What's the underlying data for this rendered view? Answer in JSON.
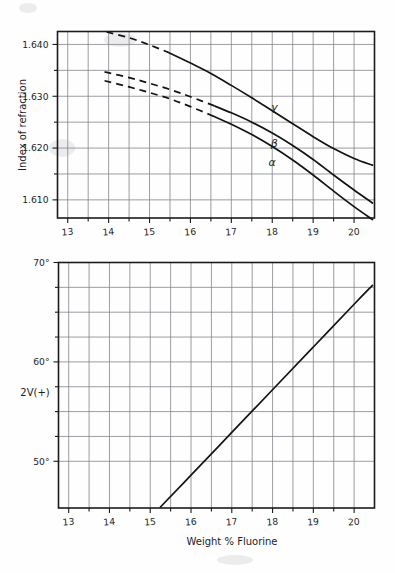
{
  "figure": {
    "background_color": "#fefefe",
    "ink_color": "#141414",
    "grid_color": "#7e7e84"
  },
  "chart_data": [
    {
      "type": "line",
      "id": "index-of-refraction-chart",
      "title": "",
      "xlabel": "",
      "ylabel": "Index of refraction",
      "xlim": [
        12.75,
        20.5
      ],
      "ylim": [
        1.6065,
        1.6425
      ],
      "grid": true,
      "legend": "inline-curve-labels",
      "x_ticks_major": [
        13,
        14,
        15,
        16,
        17,
        18,
        19,
        20
      ],
      "x_tick_labels": [
        "13",
        "14",
        "15",
        "16",
        "17",
        "18",
        "19",
        "20"
      ],
      "x_ticks_minor": [
        13.5,
        14.5,
        15.5,
        16.5,
        17.5,
        18.5,
        19.5
      ],
      "y_ticks_major": [
        1.61,
        1.62,
        1.63,
        1.64
      ],
      "y_tick_labels": [
        "1.610",
        "1.620",
        "1.630",
        "1.640"
      ],
      "y_ticks_minor": [
        1.615,
        1.625,
        1.635
      ],
      "series": [
        {
          "name": "γ",
          "label": "γ",
          "label_x": 18.05,
          "label_y": 1.6272,
          "dashed_until_x": 15.45,
          "x": [
            13.95,
            14.5,
            15.0,
            15.45,
            16.0,
            16.5,
            17.0,
            17.5,
            18.0,
            18.5,
            19.0,
            19.5,
            20.0,
            20.45
          ],
          "y": [
            1.6424,
            1.6413,
            1.6399,
            1.6385,
            1.6364,
            1.6344,
            1.6321,
            1.6297,
            1.6272,
            1.6247,
            1.6222,
            1.6199,
            1.618,
            1.6167
          ]
        },
        {
          "name": "β",
          "label": "β",
          "label_x": 18.05,
          "label_y": 1.6203,
          "dashed_until_x": 16.6,
          "x": [
            13.9,
            14.5,
            15.0,
            15.5,
            16.0,
            16.6,
            17.0,
            17.5,
            18.0,
            18.5,
            19.0,
            19.5,
            20.0,
            20.45
          ],
          "y": [
            1.6347,
            1.6336,
            1.6325,
            1.6313,
            1.6299,
            1.6281,
            1.6268,
            1.625,
            1.6229,
            1.6205,
            1.6178,
            1.6148,
            1.6119,
            1.6094
          ]
        },
        {
          "name": "α",
          "label": "α",
          "label_x": 18.0,
          "label_y": 1.6166,
          "dashed_until_x": 16.55,
          "x": [
            13.9,
            14.5,
            15.0,
            15.5,
            16.0,
            16.55,
            17.0,
            17.5,
            18.0,
            18.5,
            19.0,
            19.5,
            20.0,
            20.45
          ],
          "y": [
            1.633,
            1.6318,
            1.6307,
            1.6295,
            1.628,
            1.6262,
            1.6246,
            1.6226,
            1.6203,
            1.6177,
            1.6148,
            1.6117,
            1.6087,
            1.6062
          ]
        }
      ]
    },
    {
      "type": "line",
      "id": "optic-axial-angle-chart",
      "title": "",
      "xlabel": "Weight % Fluorine",
      "ylabel": "2V(+)",
      "xlim": [
        12.75,
        20.5
      ],
      "ylim": [
        45.3,
        70.0
      ],
      "grid": true,
      "x_ticks_major": [
        13,
        14,
        15,
        16,
        17,
        18,
        19,
        20
      ],
      "x_tick_labels": [
        "13",
        "14",
        "15",
        "16",
        "17",
        "18",
        "19",
        "20"
      ],
      "x_ticks_minor": [
        13.5,
        14.5,
        15.5,
        16.5,
        17.5,
        18.5,
        19.5
      ],
      "y_ticks_major": [
        50,
        60,
        70
      ],
      "y_tick_labels": [
        "50°",
        "60°",
        "70°"
      ],
      "y_ticks_minor": [
        52.5,
        55,
        57.5,
        62.5,
        65,
        67.5
      ],
      "series": [
        {
          "name": "2V(+)",
          "label": "",
          "x": [
            15.25,
            16.0,
            17.0,
            18.0,
            19.0,
            20.0,
            20.45
          ],
          "y": [
            45.4,
            48.6,
            52.9,
            57.2,
            61.5,
            65.8,
            67.7
          ]
        }
      ]
    }
  ],
  "labels": {
    "top_ylabel": "Index of refraction",
    "bottom_ylabel": "2V(+)",
    "bottom_xlabel": "Weight % Fluorine",
    "top_y_ticks": [
      "1.640",
      "1.630",
      "1.620",
      "1.610"
    ],
    "top_x_ticks": [
      "13",
      "14",
      "15",
      "16",
      "17",
      "18",
      "19",
      "20"
    ],
    "bottom_y_ticks": [
      "70°",
      "60°",
      "50°"
    ],
    "bottom_x_ticks": [
      "13",
      "14",
      "15",
      "16",
      "17",
      "18",
      "19",
      "20"
    ],
    "curve_gamma": "γ",
    "curve_beta": "β",
    "curve_alpha": "α"
  }
}
